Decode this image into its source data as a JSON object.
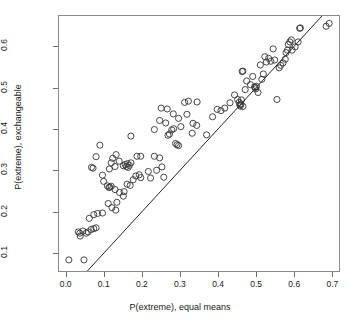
{
  "chart_data": {
    "type": "scatter",
    "title": "",
    "xlabel": "P(extreme), equal means",
    "ylabel": "P(extreme), exchangeable",
    "xlim": [
      -0.02,
      0.72
    ],
    "ylim": [
      0.055,
      0.675
    ],
    "xticks": [
      0.0,
      0.1,
      0.2,
      0.3,
      0.4,
      0.5,
      0.6,
      0.7
    ],
    "xticklabels": [
      "0.0",
      "0.1",
      "0.2",
      "0.3",
      "0.4",
      "0.5",
      "0.6",
      "0.7"
    ],
    "yticks": [
      0.1,
      0.2,
      0.3,
      0.4,
      0.5,
      0.6
    ],
    "yticklabels": [
      "0.1",
      "0.2",
      "0.3",
      "0.4",
      "0.5",
      "0.6"
    ],
    "grid": false,
    "legend": null,
    "marker": "open-circle",
    "marker_color": "#333333",
    "marker_size": 3.1,
    "reference_line": {
      "type": "identity",
      "slope": 1.0,
      "intercept": 0.0,
      "color": "#222222",
      "width": 1.0
    },
    "series": [
      {
        "name": "simulations",
        "points": [
          [
            0.006,
            0.082
          ],
          [
            0.046,
            0.082
          ],
          [
            0.031,
            0.15
          ],
          [
            0.035,
            0.147
          ],
          [
            0.036,
            0.14
          ],
          [
            0.043,
            0.152
          ],
          [
            0.052,
            0.147
          ],
          [
            0.057,
            0.15
          ],
          [
            0.065,
            0.156
          ],
          [
            0.072,
            0.158
          ],
          [
            0.078,
            0.16
          ],
          [
            0.06,
            0.183
          ],
          [
            0.072,
            0.192
          ],
          [
            0.082,
            0.195
          ],
          [
            0.095,
            0.196
          ],
          [
            0.11,
            0.219
          ],
          [
            0.12,
            0.209
          ],
          [
            0.13,
            0.203
          ],
          [
            0.133,
            0.222
          ],
          [
            0.15,
            0.237
          ],
          [
            0.152,
            0.248
          ],
          [
            0.14,
            0.246
          ],
          [
            0.112,
            0.258
          ],
          [
            0.118,
            0.261
          ],
          [
            0.108,
            0.262
          ],
          [
            0.114,
            0.259
          ],
          [
            0.128,
            0.253
          ],
          [
            0.098,
            0.273
          ],
          [
            0.095,
            0.288
          ],
          [
            0.16,
            0.266
          ],
          [
            0.168,
            0.263
          ],
          [
            0.176,
            0.277
          ],
          [
            0.183,
            0.286
          ],
          [
            0.192,
            0.289
          ],
          [
            0.196,
            0.282
          ],
          [
            0.07,
            0.305
          ],
          [
            0.078,
            0.333
          ],
          [
            0.066,
            0.307
          ],
          [
            0.088,
            0.361
          ],
          [
            0.113,
            0.303
          ],
          [
            0.118,
            0.318
          ],
          [
            0.122,
            0.329
          ],
          [
            0.131,
            0.338
          ],
          [
            0.128,
            0.309
          ],
          [
            0.15,
            0.311
          ],
          [
            0.155,
            0.314
          ],
          [
            0.158,
            0.309
          ],
          [
            0.161,
            0.316
          ],
          [
            0.163,
            0.307
          ],
          [
            0.166,
            0.312
          ],
          [
            0.17,
            0.318
          ],
          [
            0.139,
            0.322
          ],
          [
            0.186,
            0.334
          ],
          [
            0.196,
            0.334
          ],
          [
            0.216,
            0.297
          ],
          [
            0.222,
            0.281
          ],
          [
            0.232,
            0.334
          ],
          [
            0.238,
            0.3
          ],
          [
            0.246,
            0.33
          ],
          [
            0.252,
            0.308
          ],
          [
            0.257,
            0.283
          ],
          [
            0.17,
            0.383
          ],
          [
            0.232,
            0.399
          ],
          [
            0.246,
            0.421
          ],
          [
            0.25,
            0.451
          ],
          [
            0.266,
            0.449
          ],
          [
            0.268,
            0.385
          ],
          [
            0.272,
            0.388
          ],
          [
            0.278,
            0.398
          ],
          [
            0.283,
            0.401
          ],
          [
            0.288,
            0.365
          ],
          [
            0.292,
            0.362
          ],
          [
            0.296,
            0.36
          ],
          [
            0.262,
            0.415
          ],
          [
            0.282,
            0.437
          ],
          [
            0.296,
            0.426
          ],
          [
            0.302,
            0.406
          ],
          [
            0.312,
            0.465
          ],
          [
            0.322,
            0.468
          ],
          [
            0.318,
            0.436
          ],
          [
            0.334,
            0.414
          ],
          [
            0.344,
            0.409
          ],
          [
            0.332,
            0.39
          ],
          [
            0.345,
            0.466
          ],
          [
            0.37,
            0.386
          ],
          [
            0.386,
            0.43
          ],
          [
            0.398,
            0.448
          ],
          [
            0.408,
            0.445
          ],
          [
            0.418,
            0.451
          ],
          [
            0.432,
            0.464
          ],
          [
            0.444,
            0.483
          ],
          [
            0.452,
            0.472
          ],
          [
            0.458,
            0.459
          ],
          [
            0.459,
            0.456
          ],
          [
            0.461,
            0.461
          ],
          [
            0.456,
            0.465
          ],
          [
            0.462,
            0.471
          ],
          [
            0.466,
            0.455
          ],
          [
            0.464,
            0.54
          ],
          [
            0.466,
            0.541
          ],
          [
            0.472,
            0.496
          ],
          [
            0.476,
            0.517
          ],
          [
            0.486,
            0.508
          ],
          [
            0.492,
            0.528
          ],
          [
            0.498,
            0.501
          ],
          [
            0.5,
            0.498
          ],
          [
            0.502,
            0.504
          ],
          [
            0.497,
            0.503
          ],
          [
            0.506,
            0.489
          ],
          [
            0.512,
            0.556
          ],
          [
            0.516,
            0.521
          ],
          [
            0.52,
            0.534
          ],
          [
            0.524,
            0.576
          ],
          [
            0.528,
            0.563
          ],
          [
            0.534,
            0.572
          ],
          [
            0.54,
            0.565
          ],
          [
            0.546,
            0.595
          ],
          [
            0.55,
            0.568
          ],
          [
            0.556,
            0.472
          ],
          [
            0.562,
            0.549
          ],
          [
            0.566,
            0.555
          ],
          [
            0.572,
            0.561
          ],
          [
            0.578,
            0.57
          ],
          [
            0.58,
            0.586
          ],
          [
            0.584,
            0.592
          ],
          [
            0.586,
            0.606
          ],
          [
            0.59,
            0.612
          ],
          [
            0.594,
            0.617
          ],
          [
            0.596,
            0.592
          ],
          [
            0.604,
            0.6
          ],
          [
            0.612,
            0.612
          ],
          [
            0.616,
            0.645
          ],
          [
            0.618,
            0.646
          ],
          [
            0.686,
            0.65
          ],
          [
            0.694,
            0.657
          ]
        ]
      }
    ]
  }
}
